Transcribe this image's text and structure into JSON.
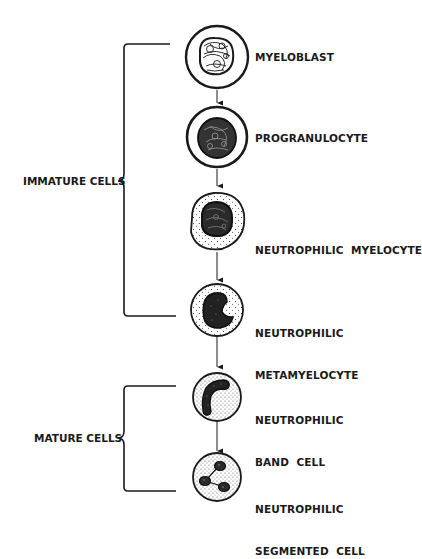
{
  "groups": [
    {
      "label": "IMMATURE CELLS"
    },
    {
      "label": "MATURE CELLS"
    }
  ],
  "stages": [
    {
      "name": "MYELOBLAST",
      "line1": "MYELOBLAST",
      "line2": ""
    },
    {
      "name": "PROGRANULOCYTE",
      "line1": "PROGRANULOCYTE",
      "line2": ""
    },
    {
      "name": "NEUTROPHILIC MYELOCYTE",
      "line1": "NEUTROPHILIC  MYELOCYTE",
      "line2": ""
    },
    {
      "name": "NEUTROPHILIC METAMYELOCYTE",
      "line1": "NEUTROPHILIC",
      "line2": "METAMYELOCYTE"
    },
    {
      "name": "NEUTROPHILIC BAND CELL",
      "line1": "NEUTROPHILIC",
      "line2": "BAND  CELL"
    },
    {
      "name": "NEUTROPHILIC SEGMENTED CELL",
      "line1": "NEUTROPHILIC",
      "line2": "SEGMENTED  CELL"
    }
  ],
  "colors": {
    "ink": "#1a1a1a",
    "background": "#ffffff"
  }
}
